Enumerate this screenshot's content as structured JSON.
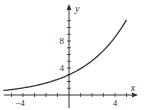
{
  "chart_data": {
    "type": "line",
    "title": "",
    "xlabel": "x",
    "ylabel": "y",
    "xlim": [
      -5.5,
      6
    ],
    "ylim": [
      -1,
      12.5
    ],
    "grid": false,
    "legend": null,
    "x_tick_labels": [
      "-4",
      "4"
    ],
    "y_tick_labels": [
      "4",
      "8"
    ],
    "x_ticks": [
      -5,
      -4,
      -3,
      -2,
      -1,
      1,
      2,
      3,
      4,
      5
    ],
    "y_ticks": [
      1,
      2,
      3,
      4,
      5,
      6,
      7,
      8,
      9,
      10,
      11
    ],
    "series": [
      {
        "name": "y = 3(1.3)^x",
        "x": [
          -5,
          -4,
          -3,
          -2,
          -1,
          0,
          1,
          2,
          3,
          4,
          5
        ],
        "values": [
          0.81,
          1.05,
          1.37,
          1.78,
          2.31,
          3.0,
          3.9,
          5.07,
          6.59,
          8.57,
          11.14
        ]
      }
    ],
    "y_intercept": 3,
    "colors": {
      "curve": "#333333",
      "axes": "#333333"
    }
  },
  "labels": {
    "x_axis": "x",
    "y_axis": "y",
    "x_neg4": "−4",
    "x_pos4": "4",
    "y_4": "4",
    "y_8": "8"
  }
}
